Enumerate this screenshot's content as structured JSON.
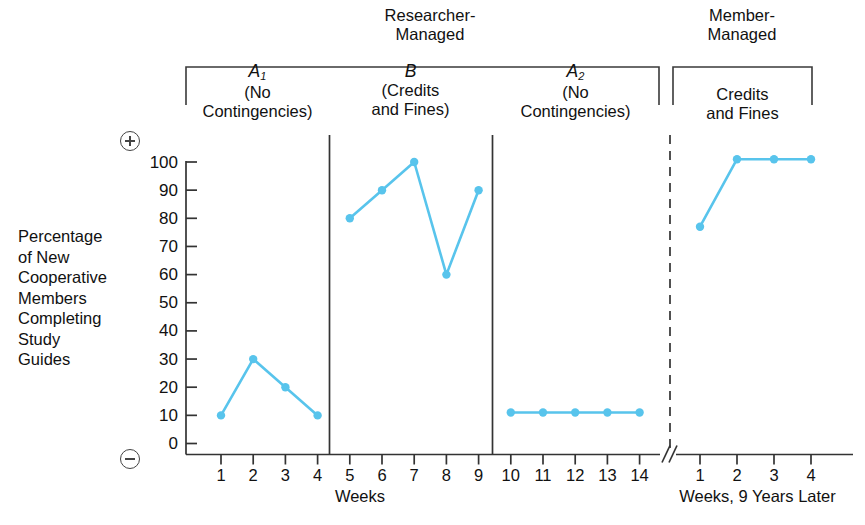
{
  "figure": {
    "group_headers": [
      {
        "id": "researcher",
        "line1": "Researcher-",
        "line2": "Managed"
      },
      {
        "id": "member",
        "line1": "Member-",
        "line2": "Managed"
      }
    ],
    "phase_labels": [
      {
        "id": "a1",
        "name": "A",
        "sub": "1",
        "line2": "(No",
        "line3": "Contingencies)"
      },
      {
        "id": "b",
        "name": "B",
        "sub": "",
        "line2": "(Credits",
        "line3": "and Fines)"
      },
      {
        "id": "a2",
        "name": "A",
        "sub": "2",
        "line2": "(No",
        "line3": "Contingencies)"
      },
      {
        "id": "mm",
        "name": "",
        "sub": "",
        "line2": "Credits",
        "line3": "and Fines"
      }
    ],
    "ylabel_lines": [
      "Percentage",
      "of New",
      "Cooperative",
      "Members",
      "Completing",
      "Study",
      "Guides"
    ],
    "polarity": {
      "top": "+",
      "bottom": "−"
    },
    "axis_names": {
      "left": "Weeks",
      "right": "Weeks, 9 Years Later"
    },
    "accent_color": "#58c4ec",
    "axis_color": "#333333"
  },
  "chart_data": {
    "type": "line",
    "title": "",
    "xlabel": "Weeks",
    "ylabel": "Percentage of New Cooperative Members Completing Study Guides",
    "ylim": [
      0,
      100
    ],
    "yticks": [
      0,
      10,
      20,
      30,
      40,
      50,
      60,
      70,
      80,
      90,
      100
    ],
    "ytick_labels": [
      "0",
      "10",
      "20",
      "30",
      "40",
      "50",
      "60",
      "70",
      "80",
      "90",
      "100"
    ],
    "grid": false,
    "legend": "none",
    "segments": [
      {
        "phase": "A1 (No Contingencies)",
        "group": "Researcher-Managed",
        "axis": "left",
        "x": [
          1,
          2,
          3,
          4
        ],
        "xtick_labels": [
          "1",
          "2",
          "3",
          "4"
        ],
        "values": [
          10,
          30,
          20,
          10
        ]
      },
      {
        "phase": "B (Credits and Fines)",
        "group": "Researcher-Managed",
        "axis": "left",
        "x": [
          5,
          6,
          7,
          8,
          9
        ],
        "xtick_labels": [
          "5",
          "6",
          "7",
          "8",
          "9"
        ],
        "values": [
          80,
          90,
          100,
          60,
          90
        ]
      },
      {
        "phase": "A2 (No Contingencies)",
        "group": "Researcher-Managed",
        "axis": "left",
        "x": [
          10,
          11,
          12,
          13,
          14
        ],
        "xtick_labels": [
          "10",
          "11",
          "12",
          "13",
          "14"
        ],
        "values": [
          11,
          11,
          11,
          11,
          11
        ]
      },
      {
        "phase": "Credits and Fines",
        "group": "Member-Managed",
        "axis": "right",
        "x": [
          1,
          2,
          3,
          4
        ],
        "xtick_labels": [
          "1",
          "2",
          "3",
          "4"
        ],
        "values": [
          77,
          101,
          101,
          101
        ]
      }
    ],
    "axis_break": true,
    "phase_separators": [
      "between week 4 and 5",
      "between week 9 and 10",
      "between week 14 and follow-up week 1 (dashed)"
    ]
  }
}
